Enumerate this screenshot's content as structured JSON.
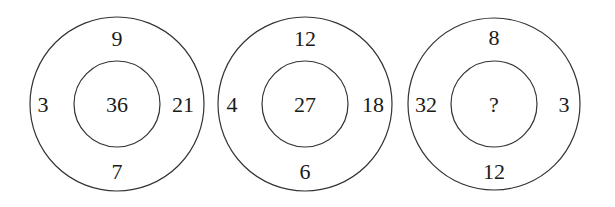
{
  "puzzle": {
    "circles": [
      {
        "top": "9",
        "left": "3",
        "right": "21",
        "bottom": "7",
        "center": "36"
      },
      {
        "top": "12",
        "left": "4",
        "right": "18",
        "bottom": "6",
        "center": "27"
      },
      {
        "top": "8",
        "left": "32",
        "right": "3",
        "bottom": "12",
        "center": "?"
      }
    ]
  },
  "colors": {
    "stroke": "#333333",
    "text": "#1a1a1a",
    "background": "#ffffff"
  }
}
